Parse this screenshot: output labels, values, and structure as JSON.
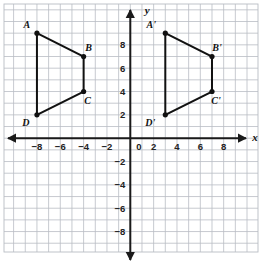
{
  "figure": {
    "title": "",
    "axis_labels": {
      "x": "x",
      "y": "y"
    },
    "origin_label": "0",
    "x_ticks": [
      "-8",
      "-6",
      "-4",
      "-2",
      "2",
      "4",
      "6",
      "8"
    ],
    "y_ticks": [
      "8",
      "6",
      "4",
      "2",
      "-2",
      "-4",
      "-6",
      "-8"
    ],
    "colors": {
      "grid": "#b9bdc4",
      "axis": "#1a1a1a",
      "shape_stroke": "#111111",
      "vertex_fill": "#111111",
      "background": "#ffffff"
    }
  },
  "chart_data": {
    "type": "scatter",
    "title": "",
    "xlabel": "x",
    "ylabel": "y",
    "xlim": [
      -10.8,
      11
    ],
    "ylim": [
      -10.5,
      10.6
    ],
    "grid": true,
    "legend": "none",
    "x_ticks": [
      -8,
      -6,
      -4,
      -2,
      2,
      4,
      6,
      8
    ],
    "y_ticks": [
      8,
      6,
      4,
      2,
      -2,
      -4,
      -6,
      -8
    ],
    "series": [
      {
        "name": "Quadrilateral ABCD",
        "closed": true,
        "points": [
          {
            "label": "A",
            "x": -8,
            "y": 9
          },
          {
            "label": "B",
            "x": -4,
            "y": 7
          },
          {
            "label": "C",
            "x": -4,
            "y": 4
          },
          {
            "label": "D",
            "x": -8,
            "y": 2
          }
        ],
        "label_offsets": [
          {
            "label": "A",
            "dx": -10,
            "dy": -5
          },
          {
            "label": "B",
            "dx": 5,
            "dy": -6
          },
          {
            "label": "C",
            "dx": 4,
            "dy": 12
          },
          {
            "label": "D",
            "dx": -11,
            "dy": 11
          }
        ]
      },
      {
        "name": "Quadrilateral A'B'C'D'",
        "closed": true,
        "points": [
          {
            "label": "A'",
            "x": 3,
            "y": 9
          },
          {
            "label": "B'",
            "x": 7,
            "y": 7
          },
          {
            "label": "C'",
            "x": 7,
            "y": 4
          },
          {
            "label": "D'",
            "x": 3,
            "y": 2
          }
        ],
        "label_offsets": [
          {
            "label": "A'",
            "dx": -14,
            "dy": -5
          },
          {
            "label": "B'",
            "dx": 5,
            "dy": -6
          },
          {
            "label": "C'",
            "dx": 4,
            "dy": 12
          },
          {
            "label": "D'",
            "dx": -15,
            "dy": 11
          }
        ]
      }
    ]
  }
}
